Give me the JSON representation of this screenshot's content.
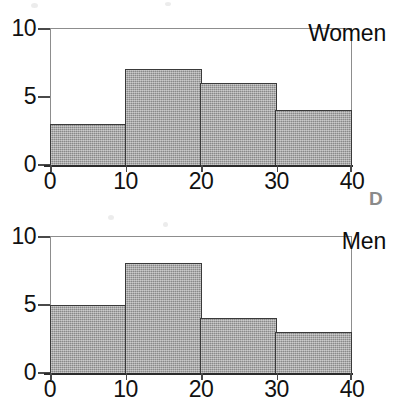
{
  "annotation": {
    "corner_label": "D"
  },
  "charts": [
    {
      "id": "women",
      "series_title": "Women",
      "y_ticks": [
        "0",
        "5",
        "10"
      ],
      "x_ticks": [
        "0",
        "10",
        "20",
        "30",
        "40"
      ]
    },
    {
      "id": "men",
      "series_title": "Men",
      "y_ticks": [
        "0",
        "5",
        "10"
      ],
      "x_ticks": [
        "0",
        "10",
        "20",
        "30",
        "40"
      ]
    }
  ],
  "chart_data": [
    {
      "type": "bar",
      "title": "Women",
      "subtitle": "",
      "xlabel": "",
      "ylabel": "",
      "categories": [
        "0-10",
        "10-20",
        "20-30",
        "30-40"
      ],
      "bin_edges": [
        0,
        10,
        20,
        30,
        40
      ],
      "values": [
        3,
        7,
        6,
        4
      ],
      "xlim": [
        0,
        40
      ],
      "ylim": [
        0,
        10
      ],
      "xticks": [
        0,
        10,
        20,
        30,
        40
      ],
      "yticks": [
        0,
        5,
        10
      ],
      "grid": false,
      "legend": false,
      "bar_fill_color": "#9a9a9a",
      "bar_edge_color": "#3a3a3a",
      "frame_color": "#8d8d8d"
    },
    {
      "type": "bar",
      "title": "Men",
      "subtitle": "",
      "xlabel": "",
      "ylabel": "",
      "categories": [
        "0-10",
        "10-20",
        "20-30",
        "30-40"
      ],
      "bin_edges": [
        0,
        10,
        20,
        30,
        40
      ],
      "values": [
        5,
        8,
        4,
        3
      ],
      "xlim": [
        0,
        40
      ],
      "ylim": [
        0,
        10
      ],
      "xticks": [
        0,
        10,
        20,
        30,
        40
      ],
      "yticks": [
        0,
        5,
        10
      ],
      "grid": false,
      "legend": false,
      "bar_fill_color": "#9a9a9a",
      "bar_edge_color": "#3a3a3a",
      "frame_color": "#8d8d8d"
    }
  ]
}
